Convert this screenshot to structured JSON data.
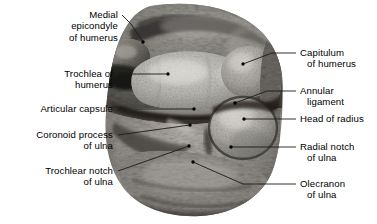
{
  "figure": {
    "type": "anatomical-photograph",
    "background_color": "#ffffff",
    "text_color": "#000000",
    "leader_color": "#1a1a1a"
  },
  "labels": {
    "left": [
      {
        "name": "medial-epicondyle-of-humerus",
        "lines": [
          "Medial",
          "epicondyle",
          "of humerus"
        ],
        "x": 118,
        "y": 9,
        "align": "right",
        "leader": [
          [
            122,
            15
          ],
          [
            131,
            24
          ],
          [
            143,
            42
          ]
        ],
        "dot": [
          143,
          42
        ]
      },
      {
        "name": "trochlea-of-humerus",
        "lines": [
          "Trochlea of",
          "humerus"
        ],
        "x": 113,
        "y": 68,
        "align": "right",
        "leader": [
          [
            118,
            74
          ],
          [
            168,
            74
          ]
        ],
        "dot": [
          168,
          74
        ]
      },
      {
        "name": "articular-capsule",
        "lines": [
          "Articular capsule"
        ],
        "x": 113,
        "y": 103,
        "align": "right",
        "leader": [
          [
            118,
            109
          ],
          [
            194,
            109
          ]
        ],
        "dot": [
          194,
          109
        ]
      },
      {
        "name": "coronoid-process-of-ulna",
        "lines": [
          "Coronoid process",
          "of ulna"
        ],
        "x": 113,
        "y": 129,
        "align": "right",
        "leader": [
          [
            118,
            135
          ],
          [
            190,
            125
          ]
        ],
        "dot": [
          190,
          125
        ]
      },
      {
        "name": "trochlear-notch-of-ulna",
        "lines": [
          "Trochlear notch",
          "of ulna"
        ],
        "x": 113,
        "y": 165,
        "align": "right",
        "leader": [
          [
            118,
            171
          ],
          [
            189,
            146
          ]
        ],
        "dot": [
          189,
          146
        ]
      }
    ],
    "right": [
      {
        "name": "capitulum-of-humerus",
        "lines": [
          "Capitulum",
          "of humerus"
        ],
        "x": 300,
        "y": 47,
        "align": "left",
        "leader": [
          [
            296,
            53
          ],
          [
            272,
            53
          ],
          [
            243,
            64
          ]
        ],
        "dot": [
          243,
          64
        ]
      },
      {
        "name": "annular-ligament",
        "lines": [
          "Annular",
          "ligament"
        ],
        "x": 300,
        "y": 85,
        "align": "left",
        "leader": [
          [
            296,
            91
          ],
          [
            267,
            91
          ],
          [
            235,
            103
          ]
        ],
        "dot": [
          235,
          103
        ]
      },
      {
        "name": "head-of-radius",
        "lines": [
          "Head of radius"
        ],
        "x": 300,
        "y": 113,
        "align": "left",
        "leader": [
          [
            296,
            119
          ],
          [
            244,
            119
          ]
        ],
        "dot": [
          244,
          119
        ]
      },
      {
        "name": "radial-notch-of-ulna",
        "lines": [
          "Radial notch",
          "of ulna"
        ],
        "x": 300,
        "y": 141,
        "align": "left",
        "leader": [
          [
            296,
            147
          ],
          [
            231,
            147
          ]
        ],
        "dot": [
          231,
          147
        ]
      },
      {
        "name": "olecranon-of-ulna",
        "lines": [
          "Olecranon",
          "of ulna"
        ],
        "x": 300,
        "y": 178,
        "align": "left",
        "leader": [
          [
            296,
            184
          ],
          [
            243,
            184
          ],
          [
            193,
            162
          ]
        ],
        "dot": [
          193,
          162
        ]
      }
    ]
  }
}
